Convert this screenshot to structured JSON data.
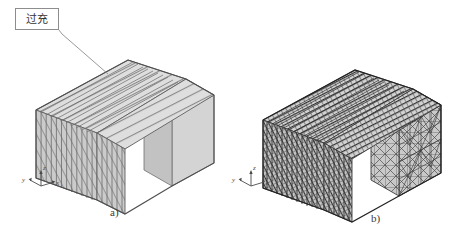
{
  "figure": {
    "background_color": "#ffffff",
    "width": 454,
    "height": 238,
    "callout": {
      "text": "过充",
      "border_color": "#8d8d8d",
      "leader_line": true
    },
    "subfigures": [
      {
        "id": "a",
        "label": "a)",
        "description": "coarse hexahedral layered mesh block",
        "mesh_style": "layered-slabs",
        "face_fill": "#d6d6d6",
        "edge_color": "#5a5a5a",
        "axis_triad": {
          "x_label": "x",
          "y_label": "y",
          "z_label": "z"
        }
      },
      {
        "id": "b",
        "label": "b)",
        "description": "fine tetrahedral / triangulated mesh block",
        "mesh_style": "triangulated",
        "face_fill": "#cfcfcf",
        "edge_color": "#2b2b2b",
        "axis_triad": {
          "x_label": "x",
          "y_label": "y",
          "z_label": "z"
        }
      }
    ],
    "colors": {
      "top_face": "#dcdcdc",
      "front_face": "#c9c9c9",
      "side_face": "#b8b8b8",
      "line_dark": "#4c4c4c",
      "line_light": "#8f8f8f"
    }
  }
}
